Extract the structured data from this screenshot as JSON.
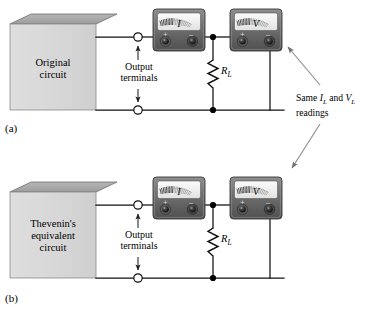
{
  "figure": {
    "panels": [
      {
        "tag": "(a)",
        "box_label_line1": "Original",
        "box_label_line2": "circuit",
        "box_label_line3": "",
        "terminal_label_line1": "Output",
        "terminal_label_line2": "terminals",
        "resistor_label": "R",
        "resistor_sub": "L",
        "meters": [
          {
            "name": "ammeter",
            "face_label": "I",
            "plus": "+",
            "minus": "−"
          },
          {
            "name": "voltmeter",
            "face_label": "V",
            "plus": "+",
            "minus": "−"
          }
        ]
      },
      {
        "tag": "(b)",
        "box_label_line1": "Thevenin's",
        "box_label_line2": "equivalent",
        "box_label_line3": "circuit",
        "terminal_label_line1": "Output",
        "terminal_label_line2": "terminals",
        "resistor_label": "R",
        "resistor_sub": "L",
        "meters": [
          {
            "name": "ammeter",
            "face_label": "I",
            "plus": "+",
            "minus": "−"
          },
          {
            "name": "voltmeter",
            "face_label": "V",
            "plus": "+",
            "minus": "−"
          }
        ]
      }
    ],
    "annotation": {
      "line1_prefix": "Same ",
      "line1_i": "I",
      "line1_i_sub": "L",
      "line1_mid": " and ",
      "line1_v": "V",
      "line1_v_sub": "L",
      "line2": "readings"
    },
    "colors": {
      "box_front": "#d9d9d9",
      "box_top": "#a9a9a9",
      "meter_body": "#6f6f6f",
      "meter_face": "#f2f2f2",
      "wire": "#111111",
      "node": "#000000",
      "annotation_line": "#8a8a8a"
    }
  }
}
